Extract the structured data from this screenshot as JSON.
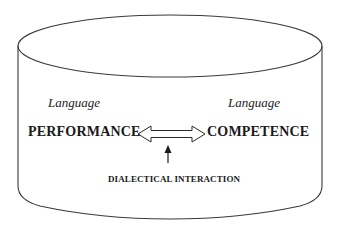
{
  "diagram": {
    "shape": "cylinder",
    "labels": {
      "left_modifier": "Language",
      "right_modifier": "Language",
      "left_concept": "PERFORMANCE",
      "right_concept": "COMPETENCE",
      "interaction_caption": "DIALECTICAL INTERACTION"
    },
    "connectors": [
      {
        "type": "double-headed-hollow-arrow",
        "from": "PERFORMANCE",
        "to": "COMPETENCE"
      },
      {
        "type": "single-headed-arrow",
        "from": "DIALECTICAL INTERACTION",
        "to": "double-headed-hollow-arrow",
        "direction": "up"
      }
    ],
    "colors": {
      "stroke": "#333333",
      "background": "#ffffff",
      "text": "#1a1a1a"
    }
  }
}
